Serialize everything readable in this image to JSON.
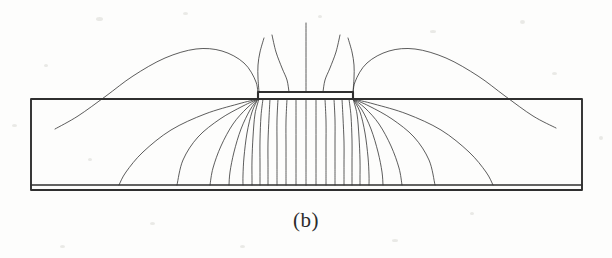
{
  "figure": {
    "caption": "(b)",
    "kind": "cross-sectional field-line diagram",
    "line_color": "#2f2f2f",
    "background_color": "#fdfdfc",
    "width": 612,
    "height": 258
  },
  "geometry": {
    "substrate": {
      "name": "substrate-block",
      "left": 31,
      "right": 582,
      "top": 99,
      "bottom": 190
    },
    "ground_plane": {
      "name": "ground-plane",
      "top": 185,
      "bottom": 190,
      "left": 31,
      "right": 582
    },
    "electrode": {
      "name": "top-electrode",
      "left": 258,
      "right": 353,
      "top": 92,
      "bottom": 99
    },
    "symmetry_axis_x": 306
  },
  "chart_data": {
    "type": "line",
    "title": "(b)",
    "xlabel": "",
    "ylabel": "",
    "grid": false,
    "legend": null,
    "xlim": [
      0,
      612
    ],
    "ylim": [
      258,
      0
    ],
    "series": [
      {
        "name": "air-line-center",
        "points": [
          [
            306,
            23
          ],
          [
            306,
            92
          ]
        ]
      },
      {
        "name": "air-line-left-inner",
        "points": [
          [
            272,
            35
          ],
          [
            276,
            52
          ],
          [
            282,
            68
          ],
          [
            287,
            80
          ],
          [
            289,
            92
          ]
        ]
      },
      {
        "name": "air-line-right-inner",
        "points": [
          [
            340,
            35
          ],
          [
            336,
            52
          ],
          [
            330,
            68
          ],
          [
            325,
            80
          ],
          [
            323,
            92
          ]
        ]
      },
      {
        "name": "air-line-left-outer",
        "points": [
          [
            264,
            38
          ],
          [
            260,
            52
          ],
          [
            258,
            65
          ],
          [
            258,
            78
          ],
          [
            259,
            92
          ]
        ]
      },
      {
        "name": "air-line-right-outer",
        "points": [
          [
            348,
            38
          ],
          [
            352,
            52
          ],
          [
            354,
            65
          ],
          [
            354,
            78
          ],
          [
            353,
            92
          ]
        ]
      },
      {
        "name": "fringe-arc-left",
        "points": [
          [
            258,
            99
          ],
          [
            256,
            82
          ],
          [
            244,
            63
          ],
          [
            222,
            51
          ],
          [
            196,
            49
          ],
          [
            165,
            58
          ],
          [
            133,
            76
          ],
          [
            106,
            96
          ],
          [
            78,
            116
          ],
          [
            55,
            129
          ]
        ]
      },
      {
        "name": "fringe-arc-right",
        "points": [
          [
            353,
            99
          ],
          [
            355,
            82
          ],
          [
            367,
            63
          ],
          [
            389,
            51
          ],
          [
            415,
            49
          ],
          [
            446,
            58
          ],
          [
            478,
            76
          ],
          [
            505,
            96
          ],
          [
            533,
            116
          ],
          [
            556,
            128
          ]
        ]
      },
      {
        "name": "sub-line-L1",
        "points": [
          [
            258,
            99
          ],
          [
            238,
            104
          ],
          [
            205,
            114
          ],
          [
            171,
            130
          ],
          [
            143,
            152
          ],
          [
            126,
            172
          ],
          [
            119,
            185
          ]
        ]
      },
      {
        "name": "sub-line-L2",
        "points": [
          [
            258,
            99
          ],
          [
            243,
            106
          ],
          [
            220,
            119
          ],
          [
            198,
            137
          ],
          [
            183,
            160
          ],
          [
            177,
            185
          ]
        ]
      },
      {
        "name": "sub-line-L3",
        "points": [
          [
            258,
            99
          ],
          [
            247,
            108
          ],
          [
            233,
            124
          ],
          [
            221,
            146
          ],
          [
            213,
            168
          ],
          [
            210,
            185
          ]
        ]
      },
      {
        "name": "sub-line-L4",
        "points": [
          [
            258,
            99
          ],
          [
            250,
            110
          ],
          [
            241,
            129
          ],
          [
            234,
            152
          ],
          [
            230,
            172
          ],
          [
            229,
            185
          ]
        ]
      },
      {
        "name": "sub-line-L5",
        "points": [
          [
            258,
            99
          ],
          [
            252,
            112
          ],
          [
            247,
            133
          ],
          [
            244,
            157
          ],
          [
            243,
            175
          ],
          [
            243,
            185
          ]
        ]
      },
      {
        "name": "sub-line-L6",
        "points": [
          [
            259,
            99
          ],
          [
            255,
            114
          ],
          [
            253,
            137
          ],
          [
            252,
            160
          ],
          [
            252,
            178
          ],
          [
            252,
            185
          ]
        ]
      },
      {
        "name": "sub-line-L7",
        "points": [
          [
            263,
            99
          ],
          [
            261,
            116
          ],
          [
            260,
            140
          ],
          [
            260,
            163
          ],
          [
            260,
            180
          ],
          [
            260,
            185
          ]
        ]
      },
      {
        "name": "sub-line-L8",
        "points": [
          [
            270,
            99
          ],
          [
            269,
            118
          ],
          [
            268,
            142
          ],
          [
            268,
            165
          ],
          [
            268,
            181
          ],
          [
            268,
            185
          ]
        ]
      },
      {
        "name": "sub-line-L9",
        "points": [
          [
            278,
            99
          ],
          [
            277,
            120
          ],
          [
            277,
            144
          ],
          [
            277,
            167
          ],
          [
            277,
            182
          ],
          [
            277,
            185
          ]
        ]
      },
      {
        "name": "sub-line-L10",
        "points": [
          [
            287,
            99
          ],
          [
            286,
            121
          ],
          [
            286,
            146
          ],
          [
            286,
            168
          ],
          [
            286,
            183
          ],
          [
            286,
            185
          ]
        ]
      },
      {
        "name": "sub-line-L11",
        "points": [
          [
            296,
            99
          ],
          [
            296,
            122
          ],
          [
            296,
            147
          ],
          [
            296,
            169
          ],
          [
            296,
            183
          ],
          [
            296,
            185
          ]
        ]
      },
      {
        "name": "sub-line-center",
        "points": [
          [
            306,
            99
          ],
          [
            306,
            123
          ],
          [
            306,
            148
          ],
          [
            306,
            170
          ],
          [
            306,
            184
          ],
          [
            306,
            185
          ]
        ]
      },
      {
        "name": "sub-line-R11",
        "points": [
          [
            316,
            99
          ],
          [
            316,
            122
          ],
          [
            316,
            147
          ],
          [
            316,
            169
          ],
          [
            316,
            183
          ],
          [
            316,
            185
          ]
        ]
      },
      {
        "name": "sub-line-R10",
        "points": [
          [
            325,
            99
          ],
          [
            326,
            121
          ],
          [
            326,
            146
          ],
          [
            326,
            168
          ],
          [
            326,
            183
          ],
          [
            326,
            185
          ]
        ]
      },
      {
        "name": "sub-line-R9",
        "points": [
          [
            334,
            99
          ],
          [
            335,
            120
          ],
          [
            335,
            144
          ],
          [
            335,
            167
          ],
          [
            335,
            182
          ],
          [
            335,
            185
          ]
        ]
      },
      {
        "name": "sub-line-R8",
        "points": [
          [
            342,
            99
          ],
          [
            343,
            118
          ],
          [
            344,
            142
          ],
          [
            344,
            165
          ],
          [
            344,
            181
          ],
          [
            344,
            185
          ]
        ]
      },
      {
        "name": "sub-line-R7",
        "points": [
          [
            349,
            99
          ],
          [
            351,
            116
          ],
          [
            352,
            140
          ],
          [
            352,
            163
          ],
          [
            352,
            180
          ],
          [
            352,
            185
          ]
        ]
      },
      {
        "name": "sub-line-R6",
        "points": [
          [
            353,
            99
          ],
          [
            357,
            114
          ],
          [
            359,
            137
          ],
          [
            360,
            160
          ],
          [
            360,
            178
          ],
          [
            360,
            185
          ]
        ]
      },
      {
        "name": "sub-line-R5",
        "points": [
          [
            353,
            99
          ],
          [
            360,
            112
          ],
          [
            365,
            133
          ],
          [
            368,
            157
          ],
          [
            369,
            175
          ],
          [
            369,
            185
          ]
        ]
      },
      {
        "name": "sub-line-R4",
        "points": [
          [
            353,
            99
          ],
          [
            362,
            110
          ],
          [
            371,
            129
          ],
          [
            378,
            152
          ],
          [
            382,
            172
          ],
          [
            383,
            185
          ]
        ]
      },
      {
        "name": "sub-line-R3",
        "points": [
          [
            353,
            99
          ],
          [
            365,
            108
          ],
          [
            379,
            124
          ],
          [
            391,
            146
          ],
          [
            399,
            168
          ],
          [
            402,
            185
          ]
        ]
      },
      {
        "name": "sub-line-R2",
        "points": [
          [
            353,
            99
          ],
          [
            369,
            106
          ],
          [
            392,
            119
          ],
          [
            414,
            137
          ],
          [
            429,
            160
          ],
          [
            435,
            185
          ]
        ]
      },
      {
        "name": "sub-line-R1",
        "points": [
          [
            353,
            99
          ],
          [
            374,
            104
          ],
          [
            407,
            114
          ],
          [
            441,
            130
          ],
          [
            469,
            152
          ],
          [
            486,
            172
          ],
          [
            493,
            185
          ]
        ]
      }
    ],
    "annotations": [
      {
        "text": "(b)",
        "x": 306,
        "y": 228,
        "role": "figure-label"
      }
    ]
  },
  "speckles": [
    {
      "x": 96,
      "y": 17,
      "w": 7,
      "h": 4
    },
    {
      "x": 183,
      "y": 12,
      "w": 5,
      "h": 3
    },
    {
      "x": 318,
      "y": 15,
      "w": 4,
      "h": 3
    },
    {
      "x": 430,
      "y": 30,
      "w": 6,
      "h": 3
    },
    {
      "x": 520,
      "y": 20,
      "w": 5,
      "h": 4
    },
    {
      "x": 44,
      "y": 64,
      "w": 4,
      "h": 3
    },
    {
      "x": 552,
      "y": 72,
      "w": 5,
      "h": 3
    },
    {
      "x": 12,
      "y": 124,
      "w": 5,
      "h": 3
    },
    {
      "x": 599,
      "y": 136,
      "w": 4,
      "h": 4
    },
    {
      "x": 88,
      "y": 158,
      "w": 4,
      "h": 3
    },
    {
      "x": 240,
      "y": 245,
      "w": 5,
      "h": 3
    },
    {
      "x": 392,
      "y": 239,
      "w": 6,
      "h": 3
    },
    {
      "x": 470,
      "y": 212,
      "w": 4,
      "h": 3
    },
    {
      "x": 150,
      "y": 222,
      "w": 5,
      "h": 3
    },
    {
      "x": 60,
      "y": 245,
      "w": 5,
      "h": 3
    }
  ]
}
